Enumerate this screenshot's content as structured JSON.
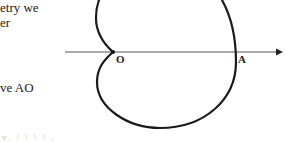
{
  "text_fragments": [
    {
      "id": "line1",
      "text": "etry we"
    },
    {
      "id": "line2",
      "text": "er"
    },
    {
      "id": "line3",
      "text": "ve  AO"
    },
    {
      "id": "line4",
      "text": "v.       / \\ \\ \\ ."
    }
  ],
  "figure": {
    "type": "cardioid",
    "points": {
      "O": "O",
      "A": "A"
    },
    "stroke_color": "#1a1a1a",
    "axis_color": "#555555"
  }
}
